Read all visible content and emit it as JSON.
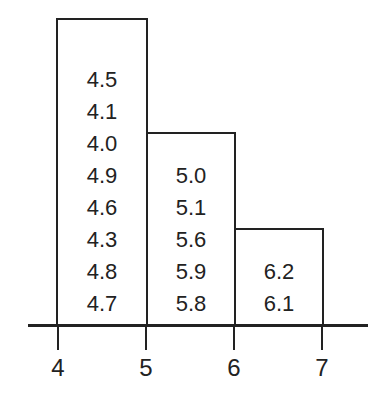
{
  "chart_data": {
    "type": "bar",
    "subtype": "histogram-stem-stacked",
    "title": "",
    "xlabel": "",
    "ylabel": "",
    "x_ticks": [
      "4",
      "5",
      "6",
      "7"
    ],
    "bins": [
      {
        "range": [
          4,
          5
        ],
        "count": 8,
        "values": [
          "4.5",
          "4.1",
          "4.0",
          "4.9",
          "4.6",
          "4.3",
          "4.8",
          "4.7"
        ]
      },
      {
        "range": [
          5,
          6
        ],
        "count": 5,
        "values": [
          "5.0",
          "5.1",
          "5.6",
          "5.9",
          "5.8"
        ]
      },
      {
        "range": [
          6,
          7
        ],
        "count": 2,
        "values": [
          "6.2",
          "6.1"
        ]
      }
    ],
    "categories": [
      "4-5",
      "5-6",
      "6-7"
    ],
    "values": [
      8,
      5,
      2
    ],
    "grid": false,
    "legend": false
  },
  "ticks": {
    "t4": "4",
    "t5": "5",
    "t6": "6",
    "t7": "7"
  }
}
